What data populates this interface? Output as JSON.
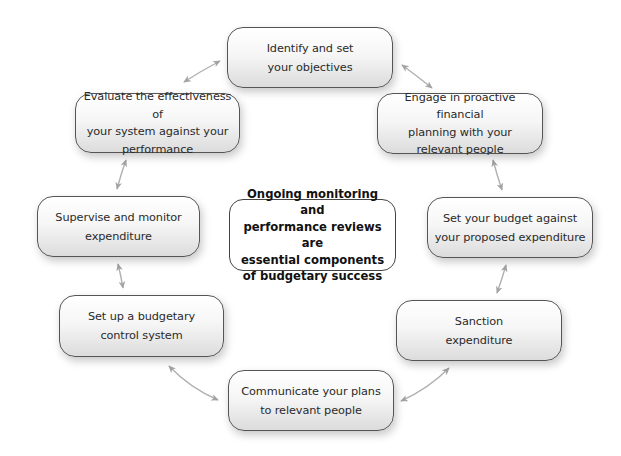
{
  "diagram": {
    "type": "cycle",
    "center": {
      "label": "Ongoing monitoring and performance reviews are essential components of budgetary success",
      "lines": [
        "Ongoing monitoring and",
        "performance reviews are",
        "essential components",
        "of budgetary success"
      ]
    },
    "nodes": [
      {
        "id": "identify",
        "label": "Identify and set your objectives",
        "lines": [
          "Identify and set",
          "your objectives"
        ]
      },
      {
        "id": "engage",
        "label": "Engage in proactive financial planning with your relevant people",
        "lines": [
          "Engage in proactive financial",
          "planning with your",
          "relevant people"
        ]
      },
      {
        "id": "set-budget",
        "label": "Set your budget against your proposed expenditure",
        "lines": [
          "Set your budget against",
          "your proposed expenditure"
        ]
      },
      {
        "id": "sanction",
        "label": "Sanction expenditure",
        "lines": [
          "Sanction",
          "expenditure"
        ]
      },
      {
        "id": "communicate",
        "label": "Communicate your plans to relevant people",
        "lines": [
          "Communicate your plans",
          "to relevant people"
        ]
      },
      {
        "id": "setup-control",
        "label": "Set up a budgetary control system",
        "lines": [
          "Set up a budgetary",
          "control system"
        ]
      },
      {
        "id": "supervise",
        "label": "Supervise and monitor expenditure",
        "lines": [
          "Supervise and monitor",
          "expenditure"
        ]
      },
      {
        "id": "evaluate",
        "label": "Evaluate the effectiveness of your system against your performance",
        "lines": [
          "Evaluate the effectiveness of",
          "your system against your",
          "performance"
        ]
      }
    ],
    "edges": [
      {
        "from": "identify",
        "to": "engage",
        "style": "double-arrow"
      },
      {
        "from": "engage",
        "to": "set-budget",
        "style": "double-arrow"
      },
      {
        "from": "set-budget",
        "to": "sanction",
        "style": "double-arrow"
      },
      {
        "from": "sanction",
        "to": "communicate",
        "style": "double-arrow"
      },
      {
        "from": "communicate",
        "to": "setup-control",
        "style": "double-arrow"
      },
      {
        "from": "setup-control",
        "to": "supervise",
        "style": "double-arrow"
      },
      {
        "from": "supervise",
        "to": "evaluate",
        "style": "double-arrow"
      },
      {
        "from": "evaluate",
        "to": "identify",
        "style": "double-arrow"
      }
    ],
    "colors": {
      "node_border": "#555555",
      "node_fill_top": "#ffffff",
      "node_fill_bottom": "#dcdcdc",
      "arrow": "#a8a8a8",
      "center_fill": "#ffffff",
      "text": "#2a2a2a"
    }
  }
}
